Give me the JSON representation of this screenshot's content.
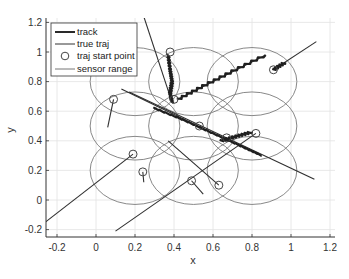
{
  "chart_data": {
    "type": "line",
    "title": "",
    "xlabel": "x",
    "ylabel": "y",
    "xlim": [
      -0.25,
      1.25
    ],
    "ylim": [
      -0.25,
      1.25
    ],
    "grid": true,
    "legend_position": "upper-left",
    "xticks": [
      -0.2,
      0,
      0.2,
      0.4,
      0.6,
      0.8,
      1,
      1.2
    ],
    "xtick_labels": [
      "-0.2",
      "0",
      "0.2",
      "0.4",
      "0.6",
      "0.8",
      "1",
      "1.2"
    ],
    "yticks": [
      -0.2,
      0,
      0.2,
      0.4,
      0.6,
      0.8,
      1,
      1.2
    ],
    "ytick_labels": [
      "-0.2",
      "0",
      "0.2",
      "0.4",
      "0.6",
      "0.8",
      "1",
      "1.2"
    ],
    "legend": [
      {
        "label": "track",
        "style": "thick-line",
        "color": "#2a2a2a"
      },
      {
        "label": "true traj",
        "style": "thin-line",
        "color": "#333333"
      },
      {
        "label": "traj start point",
        "style": "circle-marker",
        "color": "#444444"
      },
      {
        "label": "sensor range",
        "style": "thin-line",
        "color": "#777777"
      }
    ],
    "sensor_range": {
      "radius": 0.23,
      "centers": [
        [
          0.2,
          0.8
        ],
        [
          0.5,
          0.8
        ],
        [
          0.8,
          0.8
        ],
        [
          0.2,
          0.5
        ],
        [
          0.5,
          0.5
        ],
        [
          0.8,
          0.5
        ],
        [
          0.2,
          0.2
        ],
        [
          0.5,
          0.2
        ],
        [
          0.8,
          0.2
        ]
      ]
    },
    "true_traj": [
      {
        "x": [
          0.24,
          0.39
        ],
        "y": [
          1.26,
          0.66
        ]
      },
      {
        "x": [
          0.91,
          1.13
        ],
        "y": [
          0.88,
          1.07
        ]
      },
      {
        "x": [
          0.09,
          0.06
        ],
        "y": [
          0.68,
          0.49
        ]
      },
      {
        "x": [
          0.19,
          -0.26
        ],
        "y": [
          0.31,
          -0.15
        ]
      },
      {
        "x": [
          0.24,
          0.245
        ],
        "y": [
          0.19,
          0.12
        ]
      },
      {
        "x": [
          0.49,
          0.55
        ],
        "y": [
          0.13,
          0.04
        ]
      },
      {
        "x": [
          0.37,
          0.63
        ],
        "y": [
          0.4,
          0.1
        ]
      },
      {
        "x": [
          0.42,
          0.87
        ],
        "y": [
          0.68,
          0.98
        ]
      },
      {
        "x": [
          0.17,
          1.12
        ],
        "y": [
          0.73,
          0.14
        ]
      },
      {
        "x": [
          0.1,
          0.82
        ],
        "y": [
          -0.21,
          0.45
        ]
      },
      {
        "x": [
          0.13,
          0.68
        ],
        "y": [
          0.75,
          0.4
        ]
      }
    ],
    "tracks": [
      {
        "x": [
          0.37,
          0.38,
          0.39,
          0.38,
          0.39
        ],
        "y": [
          0.98,
          0.88,
          0.8,
          0.72,
          0.66
        ]
      },
      {
        "x": [
          0.91,
          0.97
        ],
        "y": [
          0.88,
          0.93
        ]
      },
      {
        "x": [
          0.42,
          0.55,
          0.7,
          0.87
        ],
        "y": [
          0.68,
          0.77,
          0.87,
          0.98
        ]
      },
      {
        "x": [
          0.3,
          0.45,
          0.6,
          0.75,
          0.85
        ],
        "y": [
          0.62,
          0.54,
          0.45,
          0.36,
          0.3
        ]
      },
      {
        "x": [
          0.64,
          0.72,
          0.8
        ],
        "y": [
          0.4,
          0.43,
          0.46
        ]
      }
    ],
    "start_points": [
      [
        0.38,
        1.0
      ],
      [
        0.91,
        0.88
      ],
      [
        0.09,
        0.68
      ],
      [
        0.4,
        0.68
      ],
      [
        0.53,
        0.5
      ],
      [
        0.67,
        0.42
      ],
      [
        0.82,
        0.45
      ],
      [
        0.19,
        0.31
      ],
      [
        0.24,
        0.19
      ],
      [
        0.49,
        0.13
      ],
      [
        0.63,
        0.1
      ]
    ]
  }
}
